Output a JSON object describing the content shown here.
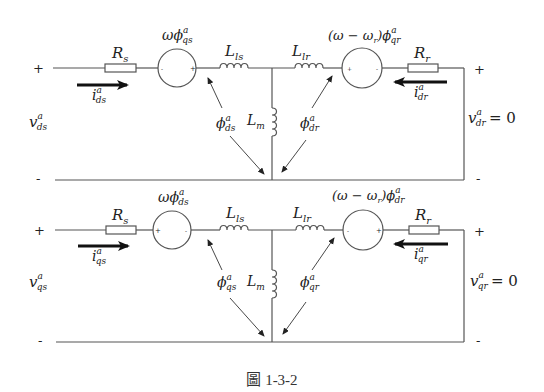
{
  "circuits": [
    {
      "axis": "d",
      "stator": {
        "voltage": "v",
        "voltage_sub": "ds",
        "sup": "a",
        "current": "i",
        "current_sub": "ds",
        "resistance": "R",
        "resistance_sub": "s",
        "source": "ωϕ",
        "source_sub": "qs",
        "source_left_sign": "-",
        "source_right_sign": "+",
        "leakage": "L",
        "leakage_sub": "ls",
        "flux": "ϕ",
        "flux_sub": "ds"
      },
      "magnetizing": {
        "label": "L",
        "label_sub": "m"
      },
      "rotor": {
        "voltage": "v",
        "voltage_sub": "dr",
        "voltage_value": "= 0",
        "sup": "a",
        "current": "i",
        "current_sub": "dr",
        "resistance": "R",
        "resistance_sub": "r",
        "source": "(ω − ω",
        "source_mid_sub": "r",
        "source_tail": ")ϕ",
        "source_sub": "qr",
        "source_left_sign": "+",
        "source_right_sign": "-",
        "leakage": "L",
        "leakage_sub": "lr",
        "flux": "ϕ",
        "flux_sub": "dr"
      },
      "terminals": {
        "left_plus": "+",
        "left_minus": "-",
        "right_plus": "+",
        "right_minus": "-"
      }
    },
    {
      "axis": "q",
      "stator": {
        "voltage": "v",
        "voltage_sub": "qs",
        "sup": "a",
        "current": "i",
        "current_sub": "qs",
        "resistance": "R",
        "resistance_sub": "s",
        "source": "ωϕ",
        "source_sub": "ds",
        "source_left_sign": "+",
        "source_right_sign": "-",
        "leakage": "L",
        "leakage_sub": "ls",
        "flux": "ϕ",
        "flux_sub": "qs"
      },
      "magnetizing": {
        "label": "L",
        "label_sub": "m"
      },
      "rotor": {
        "voltage": "v",
        "voltage_sub": "qr",
        "voltage_value": "= 0",
        "sup": "a",
        "current": "i",
        "current_sub": "qr",
        "resistance": "R",
        "resistance_sub": "r",
        "source": "(ω − ω",
        "source_mid_sub": "r",
        "source_tail": ")ϕ",
        "source_sub": "dr",
        "source_left_sign": "-",
        "source_right_sign": "+",
        "leakage": "L",
        "leakage_sub": "lr",
        "flux": "ϕ",
        "flux_sub": "qr"
      },
      "terminals": {
        "left_plus": "+",
        "left_minus": "-",
        "right_plus": "+",
        "right_minus": "-"
      }
    }
  ],
  "caption": "圖 1-3-2"
}
